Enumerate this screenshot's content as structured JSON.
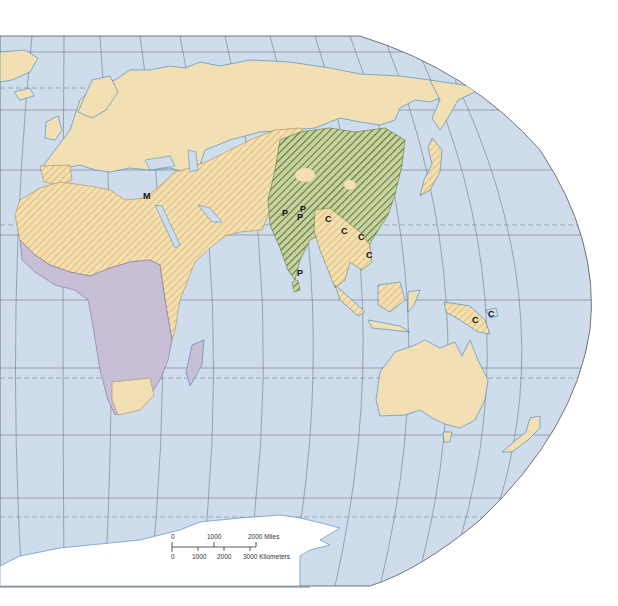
{
  "map": {
    "title": "",
    "projection": "Robinson-style (Eastern Hemisphere: Europe, Africa, Asia, Oceania)",
    "colors": {
      "ocean": "#cfdcec",
      "land_plain": "#f2dfb4",
      "land_hatched_base": "#f2dfb4",
      "hatch_orange": "#e2b45c",
      "hatch_green_base": "#b3c28c",
      "hatch_green": "#5e7a3a",
      "africa_purple": "#c8bed6",
      "antarctica": "#ffffff",
      "coast": "#3b86b8",
      "graticule": "#5a6775",
      "border": "#a78d5c"
    },
    "markers": [
      {
        "label": "M",
        "x": 148,
        "y": 196
      },
      {
        "label": "P",
        "x": 285,
        "y": 214
      },
      {
        "label": "P",
        "x": 302,
        "y": 213
      },
      {
        "label": "P",
        "x": 300,
        "y": 220
      },
      {
        "label": "P",
        "x": 298,
        "y": 273
      },
      {
        "label": "C",
        "x": 327,
        "y": 219
      },
      {
        "label": "C",
        "x": 343,
        "y": 233
      },
      {
        "label": "C",
        "x": 360,
        "y": 238
      },
      {
        "label": "C",
        "x": 368,
        "y": 256
      },
      {
        "label": "C",
        "x": 475,
        "y": 321
      },
      {
        "label": "C",
        "x": 492,
        "y": 314
      }
    ],
    "scale_bar": {
      "miles_labels": [
        "0",
        "1000",
        "2000 Miles"
      ],
      "km_labels": [
        "0",
        "1000",
        "2000",
        "3000 Kilometers"
      ]
    }
  }
}
